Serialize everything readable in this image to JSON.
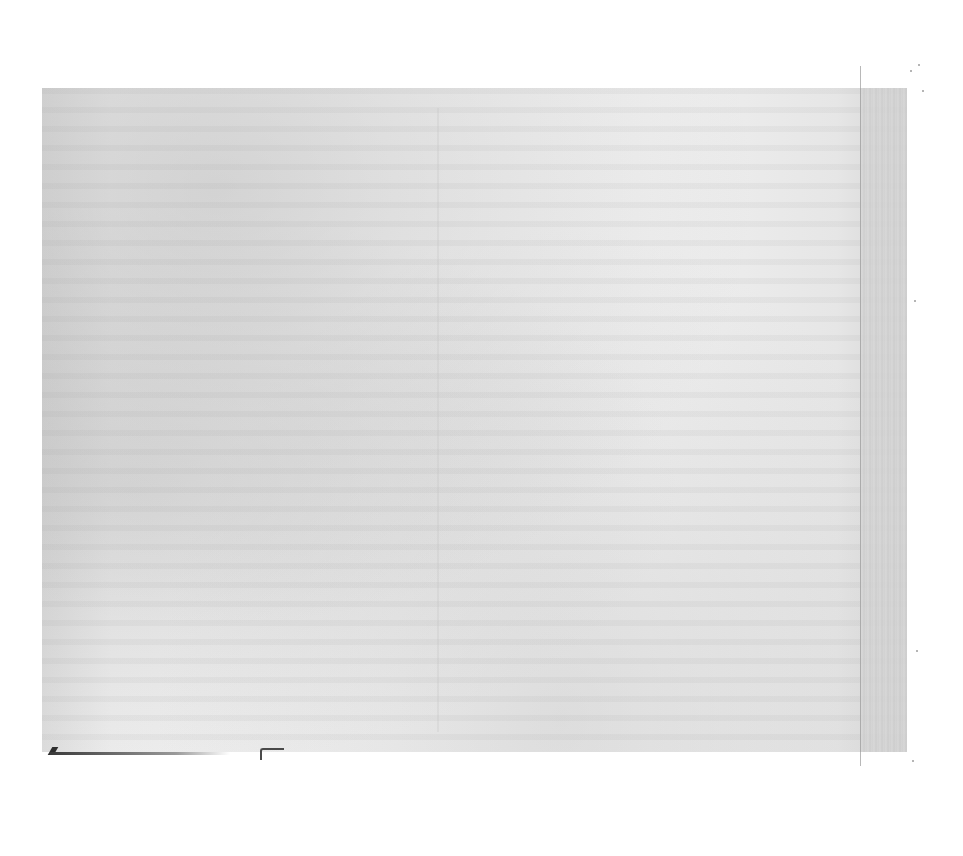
{
  "document": {
    "type": "scanned-page",
    "legible_text": "",
    "page": {
      "background_color": "#ececec",
      "gutter_color": "#d2d2d2",
      "paper_color": "#ffffff"
    }
  }
}
